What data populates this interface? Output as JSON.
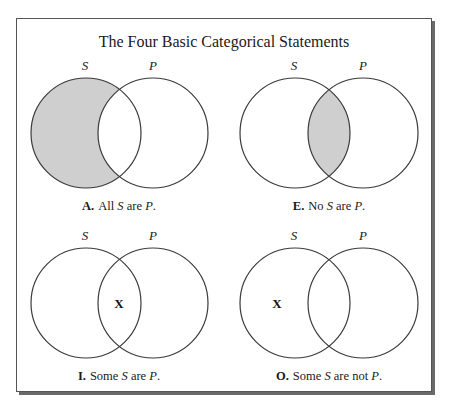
{
  "title": "The Four Basic Categorical Statements",
  "colors": {
    "shade": "#cfcfcf",
    "stroke": "#3a3a3a",
    "frame_shadow": "#6a6a6a"
  },
  "panels": [
    {
      "id": "A",
      "letter": "A.",
      "set_labels": [
        "S",
        "P"
      ],
      "caption_parts": [
        "All ",
        "S",
        " are ",
        "P",
        "."
      ],
      "shaded_region": "S-only",
      "x_mark": null,
      "statement": "All S are P."
    },
    {
      "id": "E",
      "letter": "E.",
      "set_labels": [
        "S",
        "P"
      ],
      "caption_parts": [
        "No ",
        "S",
        " are ",
        "P",
        "."
      ],
      "shaded_region": "S-and-P",
      "x_mark": null,
      "statement": "No S are P."
    },
    {
      "id": "I",
      "letter": "I.",
      "set_labels": [
        "S",
        "P"
      ],
      "caption_parts": [
        "Some ",
        "S",
        " are ",
        "P",
        "."
      ],
      "shaded_region": null,
      "x_mark": "X",
      "x_region": "S-and-P",
      "statement": "Some S are P."
    },
    {
      "id": "O",
      "letter": "O.",
      "set_labels": [
        "S",
        "P"
      ],
      "caption_parts": [
        "Some ",
        "S",
        " are not ",
        "P",
        "."
      ],
      "shaded_region": null,
      "x_mark": "X",
      "x_region": "S-only",
      "statement": "Some S are not P."
    }
  ]
}
